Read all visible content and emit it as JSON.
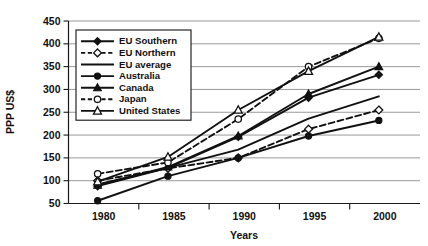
{
  "chart_data": {
    "type": "line",
    "title": "",
    "xlabel": "Years",
    "ylabel": "PPP US$",
    "x": [
      1980,
      1985,
      1990,
      1995,
      2000
    ],
    "xtick_labels": [
      "1980",
      "1985",
      "1990",
      "1995",
      "2000"
    ],
    "ytick_labels": [
      "50",
      "100",
      "150",
      "200",
      "250",
      "300",
      "350",
      "400",
      "450"
    ],
    "ylim": [
      50,
      450
    ],
    "ytick_step": 50,
    "grid": "horizontal",
    "legend_position": "top-left-inside",
    "series": [
      {
        "name": "EU Southern",
        "marker": "filled-diamond",
        "line_style": "solid",
        "values": [
          88,
          128,
          196,
          282,
          332
        ]
      },
      {
        "name": "EU Northern",
        "marker": "open-diamond",
        "line_style": "dashed",
        "values": [
          100,
          127,
          150,
          213,
          255
        ]
      },
      {
        "name": "EU average",
        "marker": "none",
        "line_style": "solid",
        "values": [
          92,
          128,
          168,
          236,
          285
        ]
      },
      {
        "name": "Australia",
        "marker": "filled-circle",
        "line_style": "solid",
        "values": [
          56,
          110,
          150,
          198,
          232
        ]
      },
      {
        "name": "Canada",
        "marker": "filled-triangle",
        "line_style": "solid",
        "values": [
          90,
          130,
          198,
          290,
          350
        ]
      },
      {
        "name": "Japan",
        "marker": "open-circle",
        "line_style": "dashed",
        "values": [
          115,
          140,
          235,
          350,
          412
        ]
      },
      {
        "name": "United States",
        "marker": "open-triangle",
        "line_style": "solid",
        "values": [
          98,
          152,
          255,
          340,
          415
        ]
      }
    ]
  },
  "axes": {
    "y_title": "PPP US$",
    "x_title": "Years"
  },
  "legend": {
    "items": [
      {
        "label": "EU Southern"
      },
      {
        "label": "EU Northern"
      },
      {
        "label": "EU average"
      },
      {
        "label": "Australia"
      },
      {
        "label": "Canada"
      },
      {
        "label": "Japan"
      },
      {
        "label": "United States"
      }
    ]
  }
}
